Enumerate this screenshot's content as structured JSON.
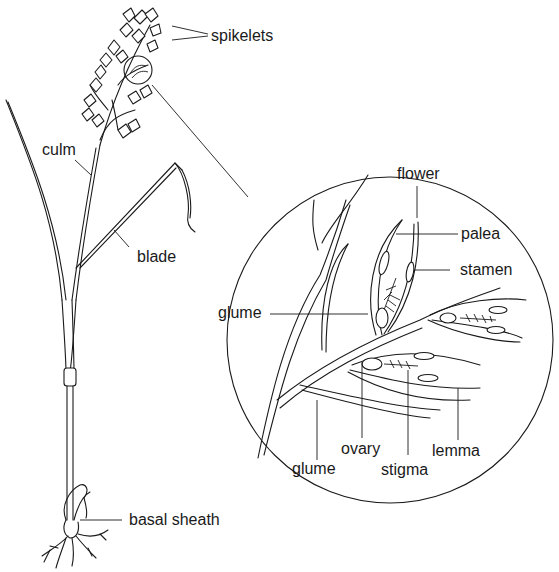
{
  "diagram": {
    "colors": {
      "ink": "#1a1a1a",
      "background": "#ffffff"
    },
    "plant_labels": {
      "spikelets": "spikelets",
      "culm": "culm",
      "blade": "blade",
      "basal_sheath": "basal sheath"
    },
    "magnified_view_labels": {
      "flower": "flower",
      "palea": "palea",
      "stamen": "stamen",
      "glume_upper": "glume",
      "glume_lower": "glume",
      "ovary": "ovary",
      "stigma": "stigma",
      "lemma": "lemma"
    }
  }
}
